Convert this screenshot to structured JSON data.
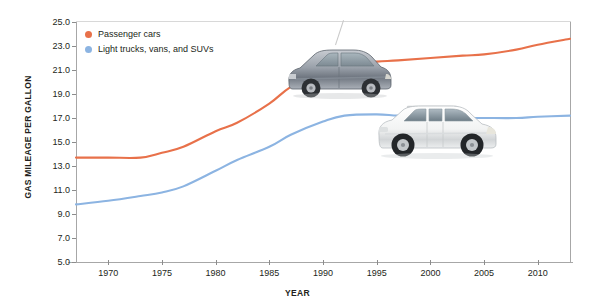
{
  "chart_data": {
    "type": "line",
    "title": "",
    "xlabel": "YEAR",
    "ylabel": "GAS MILEAGE PER GALLON",
    "xlim": [
      1967,
      2013
    ],
    "ylim": [
      5.0,
      25.0
    ],
    "grid": false,
    "legend_position": "top-left",
    "y_ticks": [
      "25.0",
      "23.0",
      "21.0",
      "19.0",
      "17.0",
      "15.0",
      "13.0",
      "11.0",
      "9.0",
      "7.0",
      "5.0"
    ],
    "y_tick_values": [
      25.0,
      23.0,
      21.0,
      19.0,
      17.0,
      15.0,
      13.0,
      11.0,
      9.0,
      7.0,
      5.0
    ],
    "x_ticks": [
      "1970",
      "1975",
      "1980",
      "1985",
      "1990",
      "1995",
      "2000",
      "2005",
      "2010"
    ],
    "x_tick_values": [
      1970,
      1975,
      1980,
      1985,
      1990,
      1995,
      2000,
      2005,
      2010
    ],
    "series": [
      {
        "name": "Passenger cars",
        "color": "#e8714a",
        "x": [
          1967,
          1970,
          1973,
          1975,
          1977,
          1980,
          1982,
          1985,
          1987,
          1990,
          1992,
          1995,
          1997,
          2000,
          2003,
          2005,
          2008,
          2010,
          2013
        ],
        "values": [
          13.7,
          13.7,
          13.7,
          14.1,
          14.6,
          15.9,
          16.6,
          18.2,
          19.6,
          21.0,
          21.5,
          21.7,
          21.8,
          22.0,
          22.2,
          22.3,
          22.7,
          23.1,
          23.6
        ]
      },
      {
        "name": "Light trucks, vans, and SUVs",
        "color": "#8cb4e2",
        "x": [
          1967,
          1970,
          1973,
          1975,
          1977,
          1980,
          1982,
          1985,
          1987,
          1990,
          1992,
          1995,
          1997,
          2000,
          2003,
          2005,
          2008,
          2010,
          2013
        ],
        "values": [
          9.8,
          10.1,
          10.5,
          10.8,
          11.3,
          12.6,
          13.5,
          14.6,
          15.6,
          16.7,
          17.2,
          17.3,
          17.2,
          17.1,
          17.0,
          17.0,
          17.0,
          17.1,
          17.2
        ]
      }
    ]
  },
  "legend": {
    "items": [
      {
        "label": "Passenger cars",
        "color": "#e8714a"
      },
      {
        "label": "Light trucks, vans, and SUVs",
        "color": "#8cb4e2"
      }
    ]
  },
  "axes": {
    "y_title": "GAS MILEAGE PER GALLON",
    "x_title": "YEAR"
  },
  "illustrations": [
    {
      "name": "passenger-car-photo",
      "description": "silver hatchback passenger car"
    },
    {
      "name": "suv-photo",
      "description": "white sport utility vehicle"
    }
  ]
}
